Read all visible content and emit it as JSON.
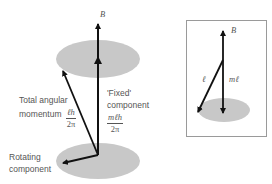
{
  "main_diagram": {
    "field_label": "B",
    "total_label": {
      "line1": "Total angular",
      "line2": "momentum",
      "fraction_num": "ℓh",
      "fraction_den": "2π"
    },
    "fixed_label": {
      "line1": "'Fixed'",
      "line2": "component",
      "fraction_num": "mℓh",
      "fraction_den": "2π"
    },
    "rotating_label": {
      "line1": "Rotating",
      "line2": "component"
    }
  },
  "inset_diagram": {
    "field_label": "B",
    "vector_label": "ℓ",
    "projection_label": "mℓ"
  },
  "colors": {
    "ellipse": "#c8c8c8",
    "arrow": "#111111",
    "text": "#555555",
    "border": "#9a9a9a"
  }
}
